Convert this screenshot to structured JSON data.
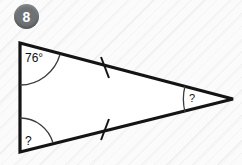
{
  "problem": {
    "number": "8"
  },
  "figure": {
    "type": "triangle",
    "stroke_color": "#141414",
    "fill_color": "#ffffff",
    "vertices": {
      "top_left": {
        "x": 20,
        "y": 43
      },
      "bottom_left": {
        "x": 20,
        "y": 152
      },
      "right": {
        "x": 233,
        "y": 99
      }
    },
    "angles": [
      {
        "id": "angle-top-left",
        "label": "76°",
        "vertex": "top_left"
      },
      {
        "id": "angle-bottom-left",
        "label": "?",
        "vertex": "bottom_left"
      },
      {
        "id": "angle-right",
        "label": "?",
        "vertex": "right"
      }
    ],
    "tick_marks": [
      {
        "id": "tick-upper-side",
        "side": "top_left-to-right",
        "count": 1
      },
      {
        "id": "tick-lower-side",
        "side": "bottom_left-to-right",
        "count": 1
      }
    ]
  }
}
